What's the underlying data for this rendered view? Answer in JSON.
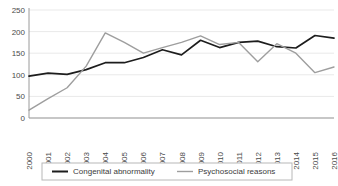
{
  "chart_data": {
    "type": "line",
    "title": "",
    "xlabel": "",
    "ylabel": "",
    "ylim": [
      0,
      250
    ],
    "yticks": [
      0,
      50,
      100,
      150,
      200,
      250
    ],
    "grid": true,
    "legend_position": "bottom",
    "categories": [
      "2000",
      "2001",
      "2002",
      "2003",
      "2004",
      "2005",
      "2006",
      "2007",
      "2008",
      "2009",
      "2010",
      "2011",
      "2012",
      "2013",
      "2014",
      "2015",
      "2016"
    ],
    "series": [
      {
        "name": "Congenital abnormality",
        "color": "#1d1d1d",
        "values": [
          97,
          104,
          101,
          112,
          128,
          128,
          140,
          158,
          146,
          180,
          163,
          175,
          178,
          165,
          162,
          191,
          185
        ]
      },
      {
        "name": "Psychosocial reasons",
        "color": "#9e9e9e",
        "values": [
          18,
          45,
          70,
          120,
          197,
          175,
          150,
          163,
          175,
          190,
          170,
          175,
          130,
          172,
          150,
          105,
          118
        ]
      }
    ]
  },
  "legend": {
    "items": [
      {
        "label": "Congenital abnormality",
        "color": "#1d1d1d"
      },
      {
        "label": "Psychosocial reasons",
        "color": "#9e9e9e"
      }
    ]
  }
}
